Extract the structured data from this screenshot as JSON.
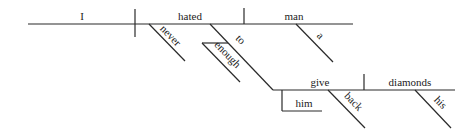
{
  "diagram": {
    "type": "sentence-diagram",
    "sentence_words": [
      "I",
      "hated",
      "never",
      "to",
      "enough",
      "man",
      "a",
      "give",
      "him",
      "back",
      "diamonds",
      "his"
    ],
    "main_clause": {
      "subject": "I",
      "verb": "hated",
      "object": "man"
    },
    "modifiers": {
      "verb_adverb": "never",
      "infinitive_marker": "to",
      "infinitive_modifier": "enough",
      "object_article": "a"
    },
    "infinitive_clause": {
      "verb": "give",
      "indirect_object": "him",
      "particle": "back",
      "direct_object": "diamonds",
      "object_determiner": "his"
    }
  }
}
